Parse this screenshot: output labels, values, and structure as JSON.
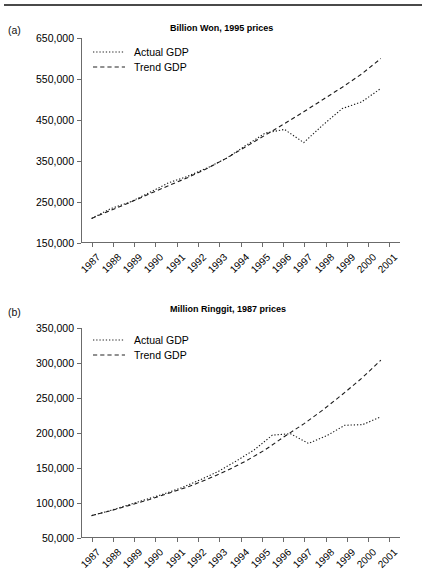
{
  "figure": {
    "panels": [
      {
        "id": "a",
        "label": "(a)",
        "title": "Billion Won, 1995 prices",
        "legend": [
          {
            "name": "Actual GDP",
            "style": "dotted"
          },
          {
            "name": "Trend GDP",
            "style": "dashed"
          }
        ]
      },
      {
        "id": "b",
        "label": "(b)",
        "title": "Million Ringgit, 1987 prices",
        "legend": [
          {
            "name": "Actual GDP",
            "style": "dotted"
          },
          {
            "name": "Trend GDP",
            "style": "dashed"
          }
        ]
      }
    ]
  },
  "chart_data": [
    {
      "type": "line",
      "panel": "(a)",
      "title": "Billion Won, 1995 prices",
      "xlabel": "",
      "ylabel": "Billion Won, 1995 prices",
      "x": [
        "1987",
        "1988",
        "1989",
        "1990",
        "1991",
        "1992",
        "1993",
        "1994",
        "1995",
        "1996",
        "1997",
        "1998",
        "1999",
        "2000",
        "2001"
      ],
      "xtick_labels": [
        "1987",
        "1988",
        "1989",
        "1990",
        "1991",
        "1992",
        "1993",
        "1994",
        "1995",
        "1996",
        "1997",
        "1998",
        "1999",
        "2000",
        "2001"
      ],
      "ytick_labels": [
        "150,000",
        "250,000",
        "350,000",
        "450,000",
        "550,000",
        "650,000"
      ],
      "ylim": [
        150000,
        650000
      ],
      "ytick_values": [
        150000,
        250000,
        350000,
        450000,
        550000,
        650000
      ],
      "grid": false,
      "legend_position": "top-left",
      "series": [
        {
          "name": "Actual GDP",
          "style": "dotted",
          "values": [
            210000,
            234000,
            250000,
            273000,
            297000,
            313000,
            333000,
            357000,
            388000,
            418000,
            427000,
            395000,
            438000,
            478000,
            494000,
            527000
          ]
        },
        {
          "name": "Trend GDP",
          "style": "dashed",
          "values": [
            210000,
            230000,
            249000,
            270000,
            290000,
            310000,
            332000,
            357000,
            385000,
            413000,
            441000,
            470000,
            500000,
            530000,
            562000,
            600000
          ]
        }
      ]
    },
    {
      "type": "line",
      "panel": "(b)",
      "title": "Million Ringgit, 1987 prices",
      "xlabel": "",
      "ylabel": "Million Ringgit, 1987 prices",
      "x": [
        "1987",
        "1988",
        "1989",
        "1990",
        "1991",
        "1992",
        "1993",
        "1994",
        "1995",
        "1996",
        "1997",
        "1998",
        "1999",
        "2000",
        "2001"
      ],
      "xtick_labels": [
        "1987",
        "1988",
        "1989",
        "1990",
        "1991",
        "1992",
        "1993",
        "1994",
        "1995",
        "1996",
        "1997",
        "1998",
        "1999",
        "2000",
        "2001"
      ],
      "ytick_labels": [
        "50,000",
        "100,000",
        "150,000",
        "200,000",
        "250,000",
        "300,000",
        "350,000"
      ],
      "ylim": [
        50000,
        350000
      ],
      "ytick_values": [
        50000,
        100000,
        150000,
        200000,
        250000,
        300000,
        350000
      ],
      "grid": false,
      "legend_position": "top-left",
      "series": [
        {
          "name": "Actual GDP",
          "style": "dotted",
          "values": [
            82000,
            89000,
            97000,
            105000,
            113000,
            122000,
            133000,
            145000,
            160000,
            176000,
            197000,
            199000,
            185000,
            196000,
            211000,
            212000,
            223000
          ]
        },
        {
          "name": "Trend GDP",
          "style": "dashed",
          "values": [
            82000,
            89000,
            97000,
            105000,
            114000,
            123000,
            134000,
            146000,
            160000,
            176000,
            195000,
            213000,
            233000,
            255000,
            278000,
            304000
          ]
        }
      ]
    }
  ]
}
